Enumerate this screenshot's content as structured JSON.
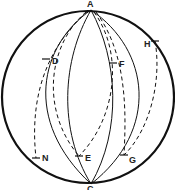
{
  "diagram": {
    "type": "sphere-great-circles",
    "colors": {
      "stroke": "#111111",
      "label": "#222222",
      "background": "#ffffff"
    },
    "points": [
      {
        "id": "A",
        "label": "A",
        "x": 91,
        "y": 10
      },
      {
        "id": "C",
        "label": "C",
        "x": 91,
        "y": 184
      },
      {
        "id": "D",
        "label": "D",
        "x": 46,
        "y": 59
      },
      {
        "id": "F",
        "label": "F",
        "x": 113,
        "y": 63
      },
      {
        "id": "H",
        "label": "H",
        "x": 155,
        "y": 41
      },
      {
        "id": "N",
        "label": "N",
        "x": 36,
        "y": 158
      },
      {
        "id": "E",
        "label": "E",
        "x": 79,
        "y": 156
      },
      {
        "id": "G",
        "label": "G",
        "x": 124,
        "y": 155
      }
    ],
    "labels": {
      "A": "A",
      "C": "C",
      "D": "D",
      "F": "F",
      "H": "H",
      "N": "N",
      "E": "E",
      "G": "G"
    },
    "solid_arcs": [
      "A-C left outer meridian",
      "A-C left inner meridian",
      "A-C right inner meridian",
      "A-C right outer meridian"
    ],
    "dashed_arcs": [
      "A-D-N",
      "A-D-E",
      "A-F-E",
      "A-F-G",
      "H-G"
    ]
  }
}
